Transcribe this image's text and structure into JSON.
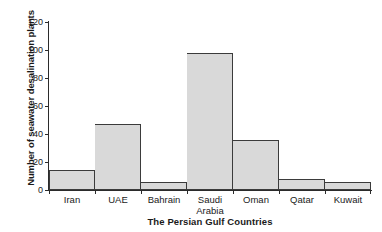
{
  "chart_data": {
    "type": "bar",
    "title": "",
    "xlabel": "The Persian Gulf Countries",
    "ylabel": "Number of seawater desalination plants",
    "categories": [
      "Iran",
      "UAE",
      "Bahrain",
      "Saudi\nArabia",
      "Oman",
      "Qatar",
      "Kuwait"
    ],
    "values": [
      14,
      47,
      6,
      98,
      36,
      8,
      6
    ],
    "ylim": [
      0,
      120
    ],
    "yticks": [
      0,
      20,
      40,
      60,
      80,
      100,
      120
    ],
    "ytick_labels": [
      "0",
      "20",
      "40",
      "60",
      "80",
      "100",
      "120"
    ],
    "grid": false,
    "legend": false,
    "bar_fill_color": "#d9d9d9",
    "bar_edge_color": "#3b3b3b",
    "axis_color": "#2b2b2b",
    "background_color": "#ffffff",
    "bar_gap": 0
  }
}
